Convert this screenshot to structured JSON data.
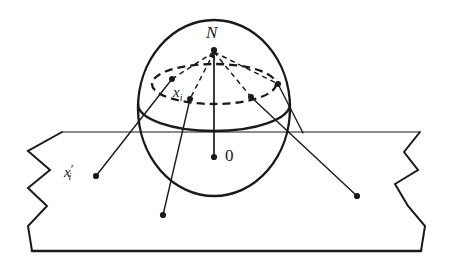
{
  "figure": {
    "type": "geometry-diagram",
    "width": 453,
    "height": 269,
    "background": "#ffffff",
    "ink_color": "#1a1a1a"
  },
  "labels": {
    "north_pole": "N",
    "origin": "0",
    "point_on_sphere": "x",
    "point_on_sphere_sub": "i",
    "projected_point": "x",
    "projected_point_prime": "′",
    "projected_point_sub": "i"
  },
  "geometry": {
    "sphere": {
      "cx": 214,
      "cy": 108,
      "rx": 76,
      "ry": 88,
      "stroke": "#1a1a1a",
      "stroke_width": 2.4,
      "fill": "none"
    },
    "equator_arc": {
      "cx": 214,
      "cy": 104,
      "rx": 76,
      "ry": 26,
      "description": "front half of equator, solid",
      "stroke_width": 2.4
    },
    "latitude_circle": {
      "cx": 214,
      "cy": 84,
      "rx": 62,
      "ry": 20,
      "description": "dashed small circle on sphere",
      "dash": "7 5",
      "stroke_width": 2.2
    },
    "axis": {
      "x": 214,
      "y_top": 52,
      "y_bottom": 157,
      "description": "solid vertical axis from origin 0 to north pole N with arrowhead",
      "stroke_width": 1.6
    },
    "north_pole_point": {
      "x": 214,
      "y": 50
    },
    "origin_point": {
      "x": 214,
      "y": 157
    },
    "sphere_points": [
      {
        "name": "p-left-upper",
        "x": 172,
        "y": 79
      },
      {
        "name": "p-xi",
        "x": 190,
        "y": 98
      },
      {
        "name": "p-right-lower",
        "x": 251,
        "y": 97
      },
      {
        "name": "p-right-upper",
        "x": 276,
        "y": 83
      }
    ],
    "plane_points": [
      {
        "name": "x-prime-i-point",
        "x": 96,
        "y": 176
      },
      {
        "name": "p-bottom-point",
        "x": 163,
        "y": 215
      },
      {
        "name": "p-right-point",
        "x": 357,
        "y": 196
      }
    ],
    "dashed_rays_from_N": [
      {
        "to_x": 172,
        "to_y": 79
      },
      {
        "to_x": 190,
        "to_y": 98
      },
      {
        "to_x": 251,
        "to_y": 97
      },
      {
        "to_x": 276,
        "to_y": 83
      }
    ],
    "projection_lines": [
      {
        "from_x": 172,
        "from_y": 79,
        "to_x": 96,
        "to_y": 176,
        "description": "x_i to x'_i on plane"
      },
      {
        "from_x": 190,
        "from_y": 98,
        "to_x": 163,
        "to_y": 215,
        "description": "sphere point down to plane"
      },
      {
        "from_x": 251,
        "from_y": 97,
        "to_x": 357,
        "to_y": 196,
        "description": "sphere point out to plane"
      },
      {
        "from_x": 276,
        "from_y": 83,
        "to_x": 300,
        "to_y": 132,
        "description": "ray toward plane edge"
      }
    ],
    "plane": {
      "description": "torn-paper parallelogram with zigzag left and right edges",
      "top_line_y": 132,
      "bottom_edge_y": 251,
      "left_zigzag": [
        [
          62,
          132
        ],
        [
          28,
          151
        ],
        [
          50,
          170
        ],
        [
          28,
          188
        ],
        [
          47,
          206
        ],
        [
          28,
          226
        ],
        [
          32,
          251
        ]
      ],
      "right_zigzag": [
        [
          420,
          132
        ],
        [
          404,
          152
        ],
        [
          418,
          170
        ],
        [
          395,
          184
        ],
        [
          408,
          206
        ],
        [
          425,
          226
        ],
        [
          421,
          251
        ]
      ],
      "stroke_width_top": 1.2,
      "stroke_width_bottom": 2.6,
      "stroke_width_sides": 2.0
    }
  },
  "label_positions": {
    "N": {
      "x": 206,
      "y": 24
    },
    "origin": {
      "x": 224,
      "y": 148
    },
    "x_i": {
      "x": 174,
      "y": 86
    },
    "x_prime_i": {
      "x": 66,
      "y": 163
    }
  }
}
